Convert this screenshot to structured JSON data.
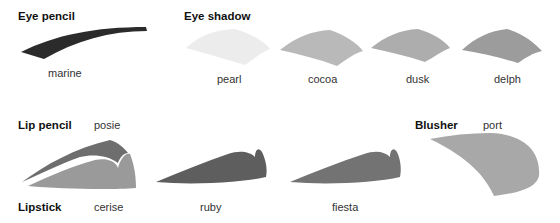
{
  "sections": {
    "eye_pencil": {
      "title": "Eye pencil",
      "shades": [
        {
          "name": "marine",
          "color": "#2b2b2b"
        }
      ]
    },
    "eye_shadow": {
      "title": "Eye shadow",
      "shades": [
        {
          "name": "pearl",
          "color": "#ececec"
        },
        {
          "name": "cocoa",
          "color": "#b9b9b9"
        },
        {
          "name": "dusk",
          "color": "#adadad"
        },
        {
          "name": "delph",
          "color": "#9c9c9c"
        }
      ]
    },
    "lip_pencil": {
      "title": "Lip pencil",
      "shades": [
        {
          "name": "posie",
          "color": "#6e6e6e"
        }
      ]
    },
    "lipstick": {
      "title": "Lipstick",
      "shades": [
        {
          "name": "cerise",
          "color": "#9a9a9a"
        },
        {
          "name": "ruby",
          "color": "#5e5e5e"
        },
        {
          "name": "fiesta",
          "color": "#737373"
        }
      ]
    },
    "blusher": {
      "title": "Blusher",
      "shades": [
        {
          "name": "port",
          "color": "#a8a8a8"
        }
      ]
    }
  }
}
